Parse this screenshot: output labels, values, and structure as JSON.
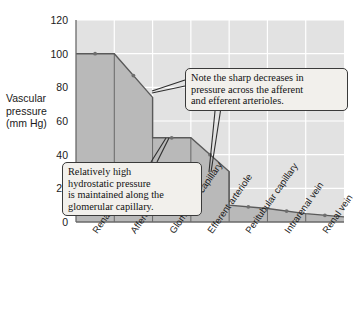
{
  "chart_data": {
    "type": "area",
    "title": "",
    "xlabel": "",
    "ylabel": "Vascular pressure (mm Hg)",
    "ylabel_lines": "Vascular\npressure\n(mm Hg)",
    "categories": [
      "Renal artery",
      "Afferent arteriole",
      "Glomerular capillary",
      "Efferent arteriole",
      "Peritubular capillary",
      "Intrarenal vein",
      "Renal vein"
    ],
    "values": [
      100,
      74,
      50,
      30,
      10,
      5,
      3
    ],
    "segment_profile": [
      {
        "category": "Renal artery",
        "start_value": 100,
        "end_value": 100
      },
      {
        "category": "Afferent arteriole",
        "start_value": 100,
        "end_value": 74
      },
      {
        "category": "Glomerular capillary",
        "start_value": 50,
        "end_value": 50
      },
      {
        "category": "Efferent arteriole",
        "start_value": 50,
        "end_value": 30
      },
      {
        "category": "Peritubular capillary",
        "start_value": 10,
        "end_value": 8
      },
      {
        "category": "Intrarenal vein",
        "start_value": 8,
        "end_value": 5
      },
      {
        "category": "Renal vein",
        "start_value": 5,
        "end_value": 3
      }
    ],
    "ylim": [
      0,
      120
    ],
    "yticks": [
      0,
      20,
      40,
      60,
      80,
      100,
      120
    ],
    "ytick_labels": [
      "0",
      "20",
      "40",
      "60",
      "80",
      "100",
      "120"
    ],
    "grid": true,
    "legend": null,
    "plot_background": "#e2e2e2",
    "gridline_color": "#ffffff",
    "area_fill": "#b9b9b9",
    "area_stroke": "#5a5a5a",
    "marker_color": "#6e6e6e"
  },
  "annotations": [
    {
      "id": "callout-top",
      "text": "Note the sharp decreases in\npressure across the afferent\nand efferent arterioles.",
      "points_to": [
        "Afferent arteriole",
        "Efferent arteriole"
      ]
    },
    {
      "id": "callout-bottom",
      "text": "Relatively high\nhydrostatic pressure\nis maintained along the\nglomerular capillary.",
      "points_to": [
        "Glomerular capillary"
      ]
    }
  ]
}
